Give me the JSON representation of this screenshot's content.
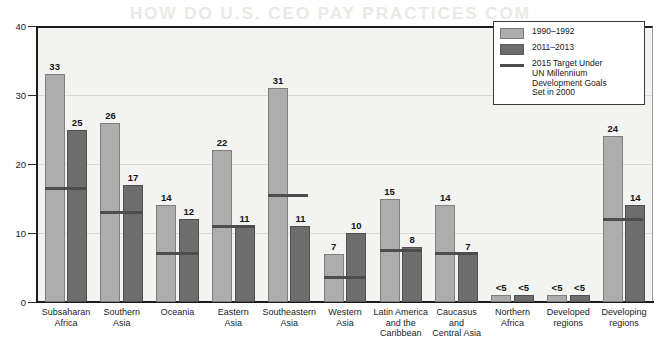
{
  "chart_data": {
    "type": "bar",
    "title": "",
    "xlabel": "",
    "ylabel": "",
    "ylim": [
      0,
      40
    ],
    "yticks": [
      0,
      10,
      20,
      30,
      40
    ],
    "grid": true,
    "legend_position": "top-right",
    "categories": [
      "Subsaharan\nAfrica",
      "Southern\nAsia",
      "Oceania",
      "Eastern\nAsia",
      "Southeastern\nAsia",
      "Western\nAsia",
      "Latin America\nand the\nCaribbean",
      "Caucasus\nand\nCentral Asia",
      "Northern\nAfrica",
      "Developed\nregions",
      "Developing\nregions"
    ],
    "series": [
      {
        "name": "1990–1992",
        "color": "#adadad",
        "values": [
          33,
          26,
          14,
          22,
          31,
          7,
          15,
          14,
          1,
          1,
          24
        ],
        "labels": [
          "33",
          "26",
          "14",
          "22",
          "31",
          "7",
          "15",
          "14",
          "<5",
          "<5",
          "24"
        ]
      },
      {
        "name": "2011–2013",
        "color": "#6d6d6d",
        "values": [
          25,
          17,
          12,
          11,
          11,
          10,
          8,
          7,
          1,
          1,
          14
        ],
        "labels": [
          "25",
          "17",
          "12",
          "11",
          "11",
          "10",
          "8",
          "7",
          "<5",
          "<5",
          "14"
        ]
      }
    ],
    "target_line": {
      "name": "2015 Target Under UN Millennium Development Goals Set in 2000",
      "color": "#4d4d4d",
      "values": [
        16.5,
        13,
        7,
        11,
        15.5,
        3.5,
        7.5,
        7,
        null,
        null,
        12
      ],
      "spans": [
        "both",
        "both",
        "both",
        "both",
        "first",
        "both",
        "both",
        "both",
        "none",
        "none",
        "first"
      ]
    }
  },
  "legend": {
    "entries": [
      {
        "label": "1990–1992",
        "swatch": "s1"
      },
      {
        "label": "2011–2013",
        "swatch": "s2"
      },
      {
        "label": "2015 Target Under\nUN Millennium Development Goals\nSet in 2000",
        "swatch": "line"
      }
    ]
  },
  "ghost_text": {
    "line1": "HOW DO U.S. CEO PAY PRACTICES COM",
    "line2": "AFFECT INVESTMENT?"
  }
}
